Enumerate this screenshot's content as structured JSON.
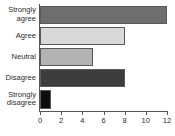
{
  "chart_data": {
    "type": "bar",
    "orientation": "horizontal",
    "title": "",
    "xlabel": "",
    "ylabel": "",
    "categories": [
      "Strongly agree",
      "Agree",
      "Neutral",
      "Disagree",
      "Strongly disagree"
    ],
    "values": [
      12,
      8,
      5,
      8,
      1
    ],
    "xlim": [
      0,
      12
    ],
    "xticks": [
      0,
      2,
      4,
      6,
      8,
      10,
      12
    ],
    "xtick_labels": [
      "0",
      "2",
      "4",
      "6",
      "8",
      "10",
      "12"
    ],
    "grid": false,
    "legend": "none",
    "bar_colors": [
      "#6e6e6e",
      "#d9d9d9",
      "#b3b3b3",
      "#3d3d3d",
      "#0d0d0d"
    ],
    "bar_edge_color": "#5a5a5a",
    "axis_color": "#555555",
    "text_color": "#2b2b2b",
    "background": "#ffffff",
    "bars": [
      {
        "category": "Strongly agree",
        "label_lines": "Strongly\nagree",
        "value": 12,
        "color": "#6e6e6e"
      },
      {
        "category": "Agree",
        "label_lines": "Agree",
        "value": 8,
        "color": "#d9d9d9"
      },
      {
        "category": "Neutral",
        "label_lines": "Neutral",
        "value": 5,
        "color": "#b3b3b3"
      },
      {
        "category": "Disagree",
        "label_lines": "Disagree",
        "value": 8,
        "color": "#3d3d3d"
      },
      {
        "category": "Strongly disagree",
        "label_lines": "Strongly\ndisagree",
        "value": 1,
        "color": "#0d0d0d"
      }
    ]
  }
}
